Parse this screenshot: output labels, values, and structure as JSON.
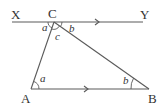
{
  "diagram": {
    "type": "geometry-parallel-lines-triangle",
    "points": {
      "X": {
        "label": "X"
      },
      "Y": {
        "label": "Y"
      },
      "C": {
        "label": "C"
      },
      "A": {
        "label": "A"
      },
      "B": {
        "label": "B"
      }
    },
    "angles": {
      "xca": "a",
      "ycb": "b",
      "acb": "c",
      "cab": "a",
      "abc": "b"
    },
    "lines": [
      "XY",
      "AB",
      "CA",
      "CB"
    ],
    "parallel_marks": [
      "XY",
      "AB"
    ],
    "colors": {
      "line": "#5a5a5a",
      "text": "#333333",
      "background": "#ffffff"
    }
  }
}
